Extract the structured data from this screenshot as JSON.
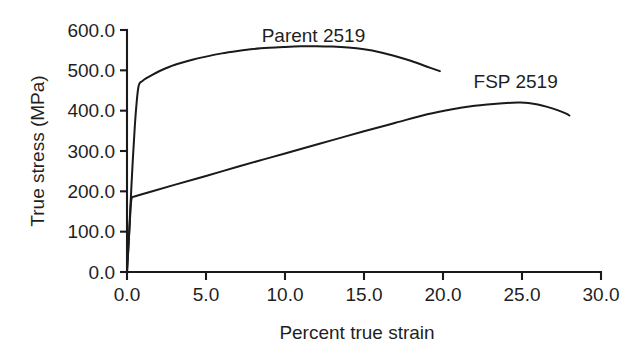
{
  "chart_data": {
    "type": "line",
    "title": "",
    "xlabel": "Percent true strain",
    "ylabel": "True stress (MPa)",
    "xlim": [
      0.0,
      30.0
    ],
    "ylim": [
      0.0,
      600.0
    ],
    "xticks": [
      "0.0",
      "5.0",
      "10.0",
      "15.0",
      "20.0",
      "25.0",
      "30.0"
    ],
    "xtick_values": [
      0.0,
      5.0,
      10.0,
      15.0,
      20.0,
      25.0,
      30.0
    ],
    "yticks": [
      "0.0",
      "100.0",
      "200.0",
      "300.0",
      "400.0",
      "500.0",
      "600.0"
    ],
    "ytick_values": [
      0.0,
      100.0,
      200.0,
      300.0,
      400.0,
      500.0,
      600.0
    ],
    "grid": false,
    "legend_position": "inline-annotation",
    "line_color": "#1a1a1a",
    "series": [
      {
        "name": "Parent 2519",
        "label_x": 11.8,
        "label_y": 585.0,
        "x": [
          0.0,
          0.1,
          0.2,
          0.35,
          0.5,
          0.62,
          0.72,
          0.8,
          0.95,
          1.2,
          1.6,
          2.1,
          2.7,
          3.4,
          4.2,
          5.0,
          6.0,
          7.0,
          8.0,
          9.0,
          10.0,
          11.0,
          12.0,
          13.0,
          14.0,
          15.0,
          16.0,
          17.0,
          18.0,
          19.0,
          19.8
        ],
        "y": [
          0.0,
          70.0,
          150.0,
          265.0,
          365.0,
          425.0,
          458.0,
          468.0,
          473.0,
          480.0,
          489.0,
          499.0,
          509.0,
          518.0,
          527.0,
          534.0,
          542.0,
          548.0,
          553.0,
          556.0,
          558.0,
          559.5,
          560.0,
          559.0,
          556.5,
          552.0,
          545.0,
          535.0,
          523.0,
          509.0,
          498.0
        ]
      },
      {
        "name": "FSP 2519",
        "label_x": 24.6,
        "label_y": 470.0,
        "x": [
          0.0,
          0.08,
          0.16,
          0.24,
          0.3,
          0.45,
          0.8,
          1.5,
          3.0,
          5.0,
          7.0,
          9.0,
          11.0,
          13.0,
          15.0,
          17.0,
          19.0,
          20.5,
          22.0,
          23.0,
          23.8,
          24.4,
          24.9,
          25.4,
          26.0,
          26.6,
          27.2,
          27.8,
          28.0
        ],
        "y": [
          0.0,
          55.0,
          110.0,
          165.0,
          184.0,
          187.0,
          191.0,
          199.0,
          216.0,
          238.0,
          261.0,
          283.0,
          305.0,
          327.0,
          349.0,
          370.0,
          391.0,
          403.0,
          412.0,
          416.0,
          418.5,
          419.8,
          420.0,
          419.0,
          415.5,
          409.5,
          402.0,
          392.5,
          388.0
        ]
      }
    ]
  },
  "plot_geometry": {
    "left": 127,
    "right": 601,
    "top": 30,
    "bottom": 272
  }
}
